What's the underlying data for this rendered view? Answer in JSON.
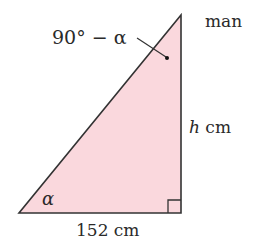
{
  "diagram": {
    "type": "right-triangle",
    "fill_color": "#fad8dd",
    "stroke_color": "#333333",
    "vertices": {
      "bottom_left": [
        19,
        213
      ],
      "bottom_right": [
        181,
        213
      ],
      "top": [
        181,
        15
      ]
    },
    "labels": {
      "top_vertex": "man",
      "top_angle": "90° − α",
      "bottom_left_angle": "α",
      "vertical_side_var": "h",
      "vertical_side_unit": " cm",
      "base_side": "152 cm"
    },
    "right_angle_marker": true
  }
}
